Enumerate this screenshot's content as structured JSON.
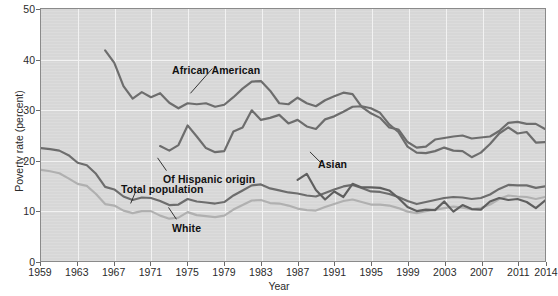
{
  "chart_data": {
    "type": "line",
    "title": "",
    "xlabel": "Year",
    "ylabel": "Poverty rate (percent)",
    "xlim": [
      1959,
      2014
    ],
    "ylim": [
      0,
      50
    ],
    "grid": true,
    "legend_position": "inline-annotations",
    "xticks": [
      "1959",
      "1963",
      "1967",
      "1971",
      "1975",
      "1979",
      "1983",
      "1987",
      "1991",
      "1995",
      "1999",
      "2003",
      "2007",
      "2011",
      "2014"
    ],
    "ytick_values": [
      0,
      10,
      20,
      30,
      40,
      50
    ],
    "yticks": [
      "0",
      "10",
      "20",
      "30",
      "40",
      "50"
    ],
    "series": [
      {
        "name": "African American",
        "color": "#6d6d6d",
        "x": [
          1966,
          1967,
          1968,
          1969,
          1970,
          1971,
          1972,
          1973,
          1974,
          1975,
          1976,
          1977,
          1978,
          1979,
          1980,
          1981,
          1982,
          1983,
          1984,
          1985,
          1986,
          1987,
          1988,
          1989,
          1990,
          1991,
          1992,
          1993,
          1994,
          1995,
          1996,
          1997,
          1998,
          1999,
          2000,
          2001,
          2002,
          2003,
          2004,
          2005,
          2006,
          2007,
          2008,
          2009,
          2010,
          2011,
          2012,
          2013,
          2014
        ],
        "values": [
          41.8,
          39.3,
          34.7,
          32.2,
          33.5,
          32.5,
          33.3,
          31.4,
          30.3,
          31.3,
          31.1,
          31.3,
          30.6,
          31.0,
          32.5,
          34.2,
          35.6,
          35.7,
          33.8,
          31.3,
          31.1,
          32.4,
          31.3,
          30.7,
          31.9,
          32.7,
          33.4,
          33.1,
          30.6,
          29.3,
          28.4,
          26.5,
          26.1,
          23.6,
          22.5,
          22.7,
          24.1,
          24.4,
          24.7,
          24.9,
          24.3,
          24.5,
          24.7,
          25.8,
          27.4,
          27.6,
          27.2,
          27.2,
          26.2
        ]
      },
      {
        "name": "Of Hispanic origin",
        "color": "#6d6d6d",
        "x": [
          1972,
          1973,
          1974,
          1975,
          1976,
          1977,
          1978,
          1979,
          1980,
          1981,
          1982,
          1983,
          1984,
          1985,
          1986,
          1987,
          1988,
          1989,
          1990,
          1991,
          1992,
          1993,
          1994,
          1995,
          1996,
          1997,
          1998,
          1999,
          2000,
          2001,
          2002,
          2003,
          2004,
          2005,
          2006,
          2007,
          2008,
          2009,
          2010,
          2011,
          2012,
          2013,
          2014
        ],
        "values": [
          22.8,
          21.9,
          23.0,
          26.9,
          24.7,
          22.4,
          21.6,
          21.8,
          25.7,
          26.5,
          29.9,
          28.0,
          28.4,
          29.0,
          27.3,
          28.0,
          26.7,
          26.2,
          28.1,
          28.7,
          29.6,
          30.6,
          30.7,
          30.3,
          29.4,
          27.1,
          25.6,
          22.7,
          21.5,
          21.4,
          21.8,
          22.5,
          21.9,
          21.8,
          20.6,
          21.5,
          23.2,
          25.3,
          26.5,
          25.3,
          25.6,
          23.5,
          23.6
        ]
      },
      {
        "name": "Total population",
        "color": "#6d6d6d",
        "x": [
          1959,
          1960,
          1961,
          1962,
          1963,
          1964,
          1965,
          1966,
          1967,
          1968,
          1969,
          1970,
          1971,
          1972,
          1973,
          1974,
          1975,
          1976,
          1977,
          1978,
          1979,
          1980,
          1981,
          1982,
          1983,
          1984,
          1985,
          1986,
          1987,
          1988,
          1989,
          1990,
          1991,
          1992,
          1993,
          1994,
          1995,
          1996,
          1997,
          1998,
          1999,
          2000,
          2001,
          2002,
          2003,
          2004,
          2005,
          2006,
          2007,
          2008,
          2009,
          2010,
          2011,
          2012,
          2013,
          2014
        ],
        "values": [
          22.4,
          22.2,
          21.9,
          21.0,
          19.5,
          19.0,
          17.3,
          14.7,
          14.2,
          12.8,
          12.1,
          12.6,
          12.5,
          11.9,
          11.1,
          11.2,
          12.3,
          11.8,
          11.6,
          11.4,
          11.7,
          13.0,
          14.0,
          15.0,
          15.2,
          14.4,
          14.0,
          13.6,
          13.4,
          13.0,
          12.8,
          13.5,
          14.2,
          14.8,
          15.1,
          14.5,
          13.8,
          13.7,
          13.3,
          12.7,
          11.9,
          11.3,
          11.7,
          12.1,
          12.5,
          12.7,
          12.6,
          12.3,
          12.5,
          13.2,
          14.3,
          15.1,
          15.0,
          15.0,
          14.5,
          14.8
        ]
      },
      {
        "name": "White",
        "color": "#b0b0b0",
        "x": [
          1959,
          1960,
          1961,
          1962,
          1963,
          1964,
          1965,
          1966,
          1967,
          1968,
          1969,
          1970,
          1971,
          1972,
          1973,
          1974,
          1975,
          1976,
          1977,
          1978,
          1979,
          1980,
          1981,
          1982,
          1983,
          1984,
          1985,
          1986,
          1987,
          1988,
          1989,
          1990,
          1991,
          1992,
          1993,
          1994,
          1995,
          1996,
          1997,
          1998,
          1999,
          2000,
          2001,
          2002,
          2003,
          2004,
          2005,
          2006,
          2007,
          2008,
          2009,
          2010,
          2011,
          2012,
          2013,
          2014
        ],
        "values": [
          18.1,
          17.8,
          17.4,
          16.4,
          15.3,
          14.9,
          13.3,
          11.3,
          11.0,
          10.0,
          9.5,
          9.9,
          9.9,
          9.0,
          8.4,
          8.6,
          9.7,
          9.1,
          8.9,
          8.7,
          9.0,
          10.2,
          11.1,
          12.0,
          12.1,
          11.5,
          11.4,
          11.0,
          10.4,
          10.1,
          10.0,
          10.7,
          11.3,
          11.9,
          12.2,
          11.7,
          11.2,
          11.2,
          11.0,
          10.5,
          9.8,
          9.5,
          9.9,
          10.2,
          10.5,
          10.8,
          10.6,
          10.3,
          10.5,
          11.2,
          12.3,
          13.0,
          12.8,
          12.7,
          12.3,
          12.7
        ]
      },
      {
        "name": "Asian",
        "color": "#5f5f5f",
        "x": [
          1987,
          1988,
          1989,
          1990,
          1991,
          1992,
          1993,
          1994,
          1995,
          1996,
          1997,
          1998,
          1999,
          2000,
          2001,
          2002,
          2003,
          2004,
          2005,
          2006,
          2007,
          2008,
          2009,
          2010,
          2011,
          2012,
          2013,
          2014
        ],
        "values": [
          16.1,
          17.3,
          14.1,
          12.2,
          13.8,
          12.7,
          15.3,
          14.6,
          14.6,
          14.5,
          14.0,
          12.5,
          10.7,
          9.9,
          10.2,
          10.1,
          11.8,
          9.8,
          11.1,
          10.3,
          10.2,
          11.8,
          12.5,
          12.1,
          12.3,
          11.7,
          10.5,
          12.0
        ]
      }
    ],
    "annotations": [
      {
        "text": "African American",
        "for": "African American"
      },
      {
        "text": "Of Hispanic origin",
        "for": "Of Hispanic origin"
      },
      {
        "text": "Total population",
        "for": "Total population"
      },
      {
        "text": "White",
        "for": "White"
      },
      {
        "text": "Asian",
        "for": "Asian"
      }
    ]
  },
  "axes": {
    "x_title": "Year",
    "y_title": "Poverty rate (percent)"
  }
}
